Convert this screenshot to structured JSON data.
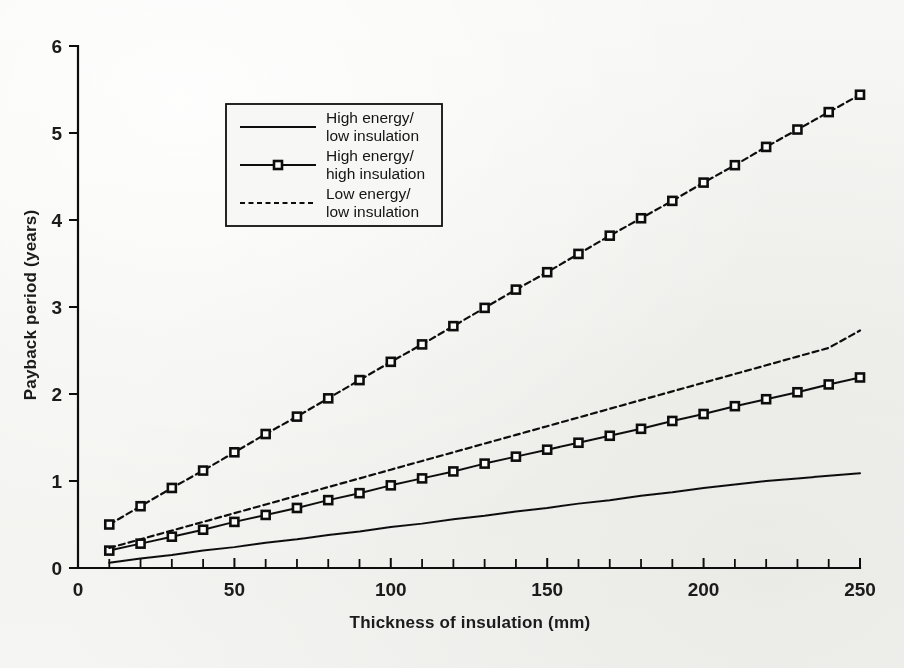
{
  "figure": {
    "background_color": "#f4f4f2",
    "ink_color": "#111111"
  },
  "chart_data": {
    "type": "line",
    "title": "",
    "xlabel": "Thickness of insulation (mm)",
    "ylabel": "Payback period (years)",
    "xlim": [
      0,
      250
    ],
    "ylim": [
      0,
      6
    ],
    "xticks": [
      0,
      10,
      20,
      30,
      40,
      50,
      60,
      70,
      80,
      90,
      100,
      110,
      120,
      130,
      140,
      150,
      160,
      170,
      180,
      190,
      200,
      210,
      220,
      230,
      240,
      250
    ],
    "xtick_labels": [
      "0",
      "",
      "",
      "",
      "",
      "50",
      "",
      "",
      "",
      "",
      "100",
      "",
      "",
      "",
      "",
      "150",
      "",
      "",
      "",
      "",
      "200",
      "",
      "",
      "",
      "",
      "250"
    ],
    "yticks": [
      0,
      1,
      2,
      3,
      4,
      5,
      6
    ],
    "ytick_labels": [
      "0",
      "1",
      "2",
      "3",
      "4",
      "5",
      "6"
    ],
    "grid": false,
    "legend_position": "upper-left-inside",
    "x": [
      10,
      20,
      30,
      40,
      50,
      60,
      70,
      80,
      90,
      100,
      110,
      120,
      130,
      140,
      150,
      160,
      170,
      180,
      190,
      200,
      210,
      220,
      230,
      240,
      250
    ],
    "series": [
      {
        "name": "High energy/ low insulation",
        "label_line1": "High energy/",
        "label_line2": "low insulation",
        "style": "solid",
        "markers": false,
        "values": [
          0.06,
          0.11,
          0.15,
          0.2,
          0.24,
          0.29,
          0.33,
          0.38,
          0.42,
          0.47,
          0.51,
          0.56,
          0.6,
          0.65,
          0.69,
          0.74,
          0.78,
          0.83,
          0.87,
          0.92,
          0.96,
          1.0,
          1.03,
          1.06,
          1.09
        ]
      },
      {
        "name": "High energy/ high insulation",
        "label_line1": "High energy/",
        "label_line2": "high insulation",
        "style": "solid",
        "markers": true,
        "values": [
          0.2,
          0.28,
          0.36,
          0.44,
          0.53,
          0.61,
          0.69,
          0.78,
          0.86,
          0.95,
          1.03,
          1.11,
          1.2,
          1.28,
          1.36,
          1.44,
          1.52,
          1.6,
          1.69,
          1.77,
          1.86,
          1.94,
          2.02,
          2.11,
          2.19
        ]
      },
      {
        "name": "Low energy/ low insulation",
        "label_line1": "Low energy/",
        "label_line2": "low insulation",
        "style": "dashed",
        "markers": false,
        "values": [
          0.23,
          0.33,
          0.43,
          0.53,
          0.63,
          0.73,
          0.83,
          0.93,
          1.03,
          1.13,
          1.23,
          1.33,
          1.43,
          1.53,
          1.63,
          1.73,
          1.83,
          1.93,
          2.03,
          2.13,
          2.23,
          2.33,
          2.43,
          2.53,
          2.73
        ]
      },
      {
        "name": "Low energy/ high insulation",
        "label_line1": "Low energy/",
        "label_line2": "high insulation",
        "style": "dashed",
        "markers": true,
        "values": [
          0.5,
          0.71,
          0.92,
          1.12,
          1.33,
          1.54,
          1.74,
          1.95,
          2.16,
          2.37,
          2.57,
          2.78,
          2.99,
          3.2,
          3.4,
          3.61,
          3.82,
          4.02,
          4.22,
          4.43,
          4.63,
          4.84,
          5.04,
          5.24,
          5.44
        ]
      }
    ],
    "legend_entries": [
      {
        "label_line1": "High energy/",
        "label_line2": "low insulation",
        "style": "solid",
        "markers": false
      },
      {
        "label_line1": "High energy/",
        "label_line2": "high insulation",
        "style": "solid",
        "markers": true
      },
      {
        "label_line1": "Low energy/",
        "label_line2": "low insulation",
        "style": "dashed",
        "markers": false
      }
    ]
  }
}
